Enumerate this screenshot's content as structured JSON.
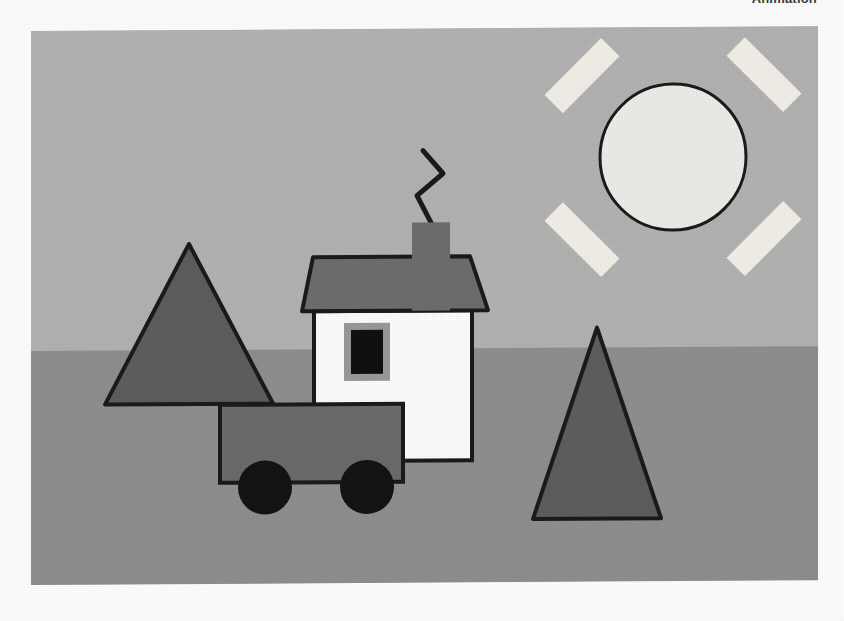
{
  "page": {
    "caption": "Animation",
    "background_color": "#ffffff"
  },
  "figure": {
    "name": "animation-scene-illustration",
    "alt_label": "Animation scene: house with smoking chimney, truck, two trees and a sun",
    "canvas": {
      "width": 787,
      "height": 554
    },
    "palette": {
      "sky": "#b3b3b3",
      "ground": "#8f8f8f",
      "outline": "#1b1b1b",
      "house_wall": "#fdfdfb",
      "roof": "#6e6e6e",
      "chimney": "#6e6e6e",
      "window_frame": "#9a9a9a",
      "window_glass": "#101010",
      "tree": "#5e5e5e",
      "truck_body": "#6b6b6b",
      "wheel": "#141414",
      "sun_disc": "#ededea",
      "sun_ray": "#f2f0e8",
      "smoke": "#1b1b1b"
    },
    "objects": [
      {
        "name": "sky",
        "label": "Sky",
        "shape": "rect"
      },
      {
        "name": "ground",
        "label": "Ground",
        "shape": "rect"
      },
      {
        "name": "sun",
        "label": "Sun",
        "shape": "circle",
        "rays": 4
      },
      {
        "name": "tree-left",
        "label": "Tree (left)",
        "shape": "triangle"
      },
      {
        "name": "tree-right",
        "label": "Tree (right)",
        "shape": "triangle"
      },
      {
        "name": "house",
        "label": "House",
        "shape": "rect"
      },
      {
        "name": "roof",
        "label": "Roof",
        "shape": "trapezoid"
      },
      {
        "name": "chimney",
        "label": "Chimney",
        "shape": "rect"
      },
      {
        "name": "smoke",
        "label": "Smoke",
        "shape": "polyline"
      },
      {
        "name": "window",
        "label": "Window",
        "shape": "rect"
      },
      {
        "name": "truck",
        "label": "Truck",
        "shape": "rect"
      },
      {
        "name": "wheel-front",
        "label": "Wheel (front)",
        "shape": "circle"
      },
      {
        "name": "wheel-rear",
        "label": "Wheel (rear)",
        "shape": "circle"
      }
    ],
    "geometry": {
      "horizon_y": 320,
      "sun": {
        "cx": 642,
        "cy": 130,
        "r": 73
      },
      "sun_rays": [
        {
          "cx": 551,
          "cy": 48,
          "w": 26,
          "h": 80,
          "angle": 45
        },
        {
          "cx": 733,
          "cy": 48,
          "w": 26,
          "h": 80,
          "angle": -45
        },
        {
          "cx": 551,
          "cy": 212,
          "w": 26,
          "h": 80,
          "angle": -45
        },
        {
          "cx": 733,
          "cy": 212,
          "w": 26,
          "h": 80,
          "angle": 45
        }
      ],
      "tree_left": {
        "apex_x": 158,
        "apex_y": 214,
        "left_x": 74,
        "right_x": 242,
        "base_y": 374
      },
      "tree_right": {
        "apex_x": 566,
        "apex_y": 300,
        "left_x": 502,
        "right_x": 630,
        "base_y": 491
      },
      "house": {
        "x": 283,
        "y": 282,
        "w": 158,
        "h": 150
      },
      "roof": {
        "top_left_x": 282,
        "top_right_x": 439,
        "bottom_left_x": 271,
        "bottom_right_x": 457,
        "top_y": 228,
        "bottom_y": 282
      },
      "chimney": {
        "x": 381,
        "y": 194,
        "w": 38,
        "h": 88
      },
      "smoke": {
        "points": "400,194 386,167 412,145 392,122"
      },
      "window": {
        "x": 313,
        "y": 294,
        "w": 46,
        "h": 58,
        "frame": 7
      },
      "truck": {
        "x": 189,
        "y": 375,
        "w": 183,
        "h": 78
      },
      "wheels": [
        {
          "cx": 234,
          "cy": 458,
          "r": 27
        },
        {
          "cx": 336,
          "cy": 458,
          "r": 27
        }
      ]
    }
  }
}
